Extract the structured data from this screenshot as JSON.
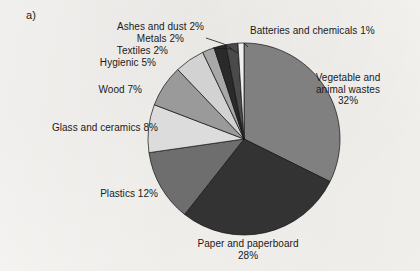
{
  "figure": {
    "panel_label": "a)",
    "background_color": "#f3f2f0"
  },
  "chart_data": {
    "type": "pie",
    "title": "",
    "subtitle": "",
    "xlabel": "",
    "ylabel": "",
    "units": "percent",
    "total": 99,
    "start_angle_deg": 0,
    "direction": "clockwise",
    "legend": "none (direct slice labels with leader lines)",
    "grid": false,
    "categories": [
      "Vegetable and animal wastes",
      "Paper and paperboard",
      "Plastics",
      "Glass and ceramics",
      "Wood",
      "Hygienic",
      "Textiles",
      "Metals",
      "Ashes and dust",
      "Batteries and chemicals"
    ],
    "values": [
      32,
      28,
      12,
      8,
      7,
      5,
      2,
      2,
      2,
      1
    ],
    "colors": [
      "#808080",
      "#333333",
      "#6e6e6e",
      "#dcdcdc",
      "#9a9a9a",
      "#d2d2d2",
      "#a8a8a8",
      "#2a2a2a",
      "#4a4a4a",
      "#efefef"
    ],
    "slice_labels": [
      "Vegetable and animal wastes 32%",
      "Paper and paperboard 28%",
      "Plastics 12%",
      "Glass and ceramics 8%",
      "Wood 7%",
      "Hygienic 5%",
      "Textiles 2%",
      "Metals 2%",
      "Ashes and dust 2%",
      "Batteries and chemicals 1%"
    ]
  },
  "labels": {
    "vegetable_line1": "Vegetable and",
    "vegetable_line2": "animal wastes",
    "vegetable_line3": "32%",
    "paper_line1": "Paper and paperboard",
    "paper_line2": "28%",
    "plastics": "Plastics 12%",
    "glass": "Glass and ceramics 8%",
    "wood": "Wood 7%",
    "hygienic": "Hygienic 5%",
    "textiles": "Textiles 2%",
    "metals": "Metals 2%",
    "ashes": "Ashes and dust 2%",
    "batteries": "Batteries and chemicals 1%"
  }
}
